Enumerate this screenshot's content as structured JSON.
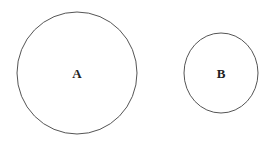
{
  "diagram": {
    "shapes": [
      {
        "id": "A",
        "label": "A",
        "type": "circle",
        "cx": 77,
        "cy": 73,
        "rx": 60,
        "ry": 61
      },
      {
        "id": "B",
        "label": "B",
        "type": "circle",
        "cx": 221,
        "cy": 73,
        "rx": 37,
        "ry": 40
      }
    ],
    "stroke_color": "#555555",
    "background": "#ffffff"
  }
}
